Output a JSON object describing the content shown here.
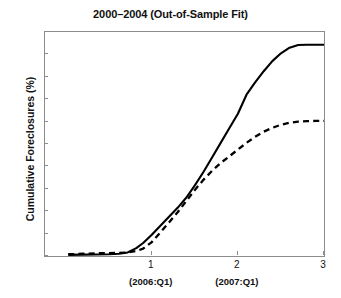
{
  "chart_data": {
    "type": "line",
    "title": "2000–2004 (Out-of-Sample Fit)",
    "xlabel": "",
    "ylabel": "Cumulative Foreclosures (%)",
    "xlim": [
      -0.24,
      3.0
    ],
    "ylim": [
      0,
      10
    ],
    "grid": false,
    "legend": null,
    "xticks": [
      {
        "value": 1,
        "label": "1",
        "sublabel": "(2006:Q1)"
      },
      {
        "value": 2,
        "label": "2",
        "sublabel": "(2007:Q1)"
      },
      {
        "value": 3,
        "label": "3",
        "sublabel": ""
      }
    ],
    "yticks": [
      {
        "value": 0,
        "label": "0"
      },
      {
        "value": 1,
        "label": "1"
      },
      {
        "value": 2,
        "label": "2"
      },
      {
        "value": 3,
        "label": "3"
      },
      {
        "value": 4,
        "label": "4"
      },
      {
        "value": 5,
        "label": "5"
      },
      {
        "value": 6,
        "label": "6"
      },
      {
        "value": 7,
        "label": "7"
      },
      {
        "value": 8,
        "label": "8"
      },
      {
        "value": 9,
        "label": "9"
      },
      {
        "value": 10,
        "label": "10"
      }
    ],
    "series": [
      {
        "name": "actual",
        "style": "solid",
        "color": "#000000",
        "x": [
          0.03,
          0.2,
          0.35,
          0.5,
          0.62,
          0.72,
          0.82,
          0.9,
          1.0,
          1.1,
          1.2,
          1.3,
          1.4,
          1.5,
          1.6,
          1.7,
          1.8,
          1.9,
          2.0,
          2.1,
          2.2,
          2.3,
          2.4,
          2.5,
          2.6,
          2.7,
          2.8,
          2.9,
          3.0
        ],
        "y": [
          0.05,
          0.06,
          0.07,
          0.08,
          0.1,
          0.16,
          0.35,
          0.58,
          0.95,
          1.35,
          1.75,
          2.15,
          2.6,
          3.15,
          3.75,
          4.4,
          5.05,
          5.7,
          6.35,
          7.2,
          7.75,
          8.25,
          8.7,
          9.05,
          9.3,
          9.42,
          9.43,
          9.43,
          9.43
        ]
      },
      {
        "name": "predicted",
        "style": "dashed",
        "color": "#000000",
        "x": [
          0.03,
          0.2,
          0.35,
          0.5,
          0.62,
          0.72,
          0.82,
          0.9,
          1.0,
          1.1,
          1.2,
          1.3,
          1.4,
          1.5,
          1.6,
          1.7,
          1.8,
          1.9,
          2.0,
          2.1,
          2.2,
          2.3,
          2.4,
          2.5,
          2.6,
          2.7,
          2.8,
          2.9,
          3.0
        ],
        "y": [
          0.08,
          0.1,
          0.12,
          0.13,
          0.14,
          0.16,
          0.22,
          0.33,
          0.62,
          1.05,
          1.5,
          1.95,
          2.45,
          2.95,
          3.4,
          3.8,
          4.15,
          4.45,
          4.75,
          5.05,
          5.32,
          5.55,
          5.72,
          5.86,
          5.95,
          6.0,
          6.02,
          6.03,
          6.03
        ]
      }
    ]
  }
}
